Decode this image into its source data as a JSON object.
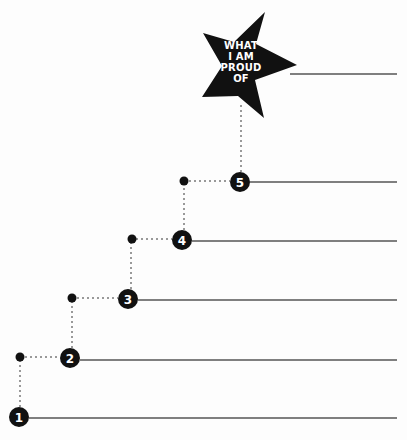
{
  "diagram": {
    "type": "staircase",
    "goal": {
      "label_lines": [
        "WHAT",
        "I AM",
        "PROUD",
        "OF"
      ],
      "shape": "star-icon",
      "line_y": 74
    },
    "steps": [
      {
        "number": "1",
        "cx": 19,
        "cy": 417,
        "line_y": 418,
        "dot": {
          "x": 20,
          "y": 357
        }
      },
      {
        "number": "2",
        "cx": 70,
        "cy": 358,
        "line_y": 360,
        "dot": {
          "x": 72,
          "y": 298
        }
      },
      {
        "number": "3",
        "cx": 128,
        "cy": 299,
        "line_y": 300,
        "dot": {
          "x": 132,
          "y": 239
        }
      },
      {
        "number": "4",
        "cx": 182,
        "cy": 240,
        "line_y": 241,
        "dot": {
          "x": 184,
          "y": 181
        }
      },
      {
        "number": "5",
        "cx": 240,
        "cy": 182,
        "line_y": 182,
        "dot": null
      }
    ],
    "line_end_x": 397,
    "colors": {
      "ink": "#111111",
      "line": "#555555",
      "dotted": "#999999",
      "background": "#fdfdfd"
    }
  }
}
